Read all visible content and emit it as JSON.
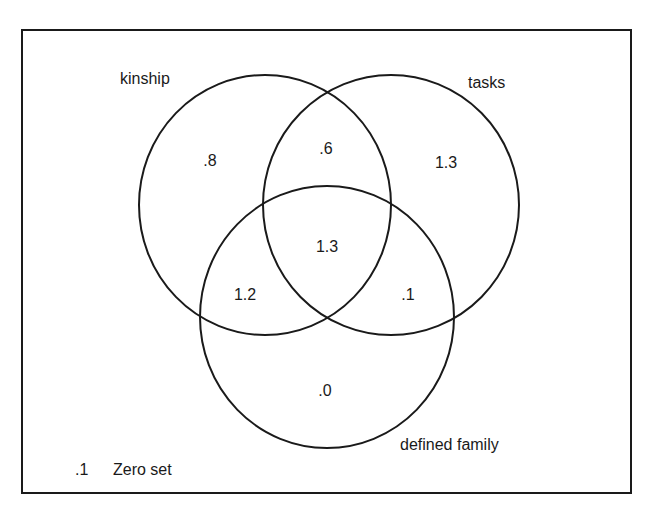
{
  "diagram": {
    "type": "venn",
    "sets": [
      {
        "id": "kinship",
        "label": "kinship"
      },
      {
        "id": "tasks",
        "label": "tasks"
      },
      {
        "id": "defined_family",
        "label": "defined family"
      }
    ],
    "regions": [
      {
        "sets": [
          "kinship"
        ],
        "value": ".8"
      },
      {
        "sets": [
          "kinship",
          "tasks"
        ],
        "value": ".6"
      },
      {
        "sets": [
          "tasks"
        ],
        "value": "1.3"
      },
      {
        "sets": [
          "kinship",
          "tasks",
          "defined_family"
        ],
        "value": "1.3"
      },
      {
        "sets": [
          "kinship",
          "defined_family"
        ],
        "value": "1.2"
      },
      {
        "sets": [
          "tasks",
          "defined_family"
        ],
        "value": ".1"
      },
      {
        "sets": [
          "defined_family"
        ],
        "value": ".0"
      }
    ],
    "legend": {
      "value": ".1",
      "label": "Zero set"
    },
    "line_color": "#1a1a1a"
  }
}
